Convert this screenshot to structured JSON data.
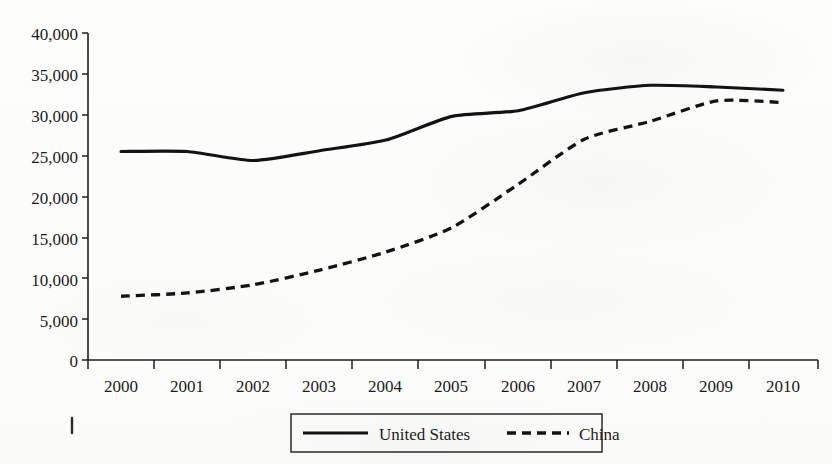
{
  "chart_data": {
    "type": "line",
    "title": "",
    "xlabel": "",
    "ylabel": "",
    "categories": [
      "2000",
      "2001",
      "2002",
      "2003",
      "2004",
      "2005",
      "2006",
      "2007",
      "2008",
      "2009",
      "2010"
    ],
    "x": [
      2000,
      2001,
      2002,
      2003,
      2004,
      2005,
      2006,
      2007,
      2008,
      2009,
      2010
    ],
    "series": [
      {
        "name": "United States",
        "style": "solid",
        "color": "#131313",
        "values": [
          25500,
          25500,
          24400,
          25600,
          26900,
          29800,
          30500,
          32700,
          33600,
          33400,
          33000
        ]
      },
      {
        "name": "China",
        "style": "dashed",
        "color": "#131313",
        "values": [
          7800,
          8200,
          9200,
          11000,
          13200,
          16200,
          21500,
          27000,
          29200,
          31700,
          31500
        ]
      }
    ],
    "ylim": [
      0,
      40000
    ],
    "ytick_labels": [
      "0",
      "5,000",
      "10,000",
      "15,000",
      "20,000",
      "25,000",
      "30,000",
      "35,000",
      "40,000"
    ],
    "ytick_values": [
      0,
      5000,
      10000,
      15000,
      20000,
      25000,
      30000,
      35000,
      40000
    ],
    "grid": false,
    "legend_position": "bottom-center",
    "legend_entries": [
      {
        "label": "United States",
        "style": "solid"
      },
      {
        "label": "China",
        "style": "dashed"
      }
    ]
  }
}
